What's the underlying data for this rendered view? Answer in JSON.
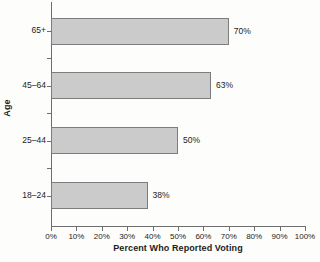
{
  "chart_data": {
    "type": "bar",
    "orientation": "horizontal",
    "title": "",
    "xlabel": "Percent Who Reported Voting",
    "ylabel": "Age",
    "categories": [
      "18–24",
      "25–44",
      "45–64",
      "65+"
    ],
    "values": [
      38,
      50,
      63,
      70
    ],
    "value_labels": [
      "38%",
      "50%",
      "63%",
      "70%"
    ],
    "xlim": [
      0,
      100
    ],
    "xticks": [
      0,
      10,
      20,
      30,
      40,
      50,
      60,
      70,
      80,
      90,
      100
    ],
    "xtick_labels": [
      "0%",
      "10%",
      "20%",
      "30%",
      "40%",
      "50%",
      "60%",
      "70%",
      "80%",
      "90%",
      "100%"
    ],
    "grid": false,
    "legend": null,
    "bar_fill_color": "#cbcbcb",
    "bar_border_color": "#7d7d7d",
    "axis_color": "#6e6e6e",
    "background_color": "#fdfdfb"
  }
}
